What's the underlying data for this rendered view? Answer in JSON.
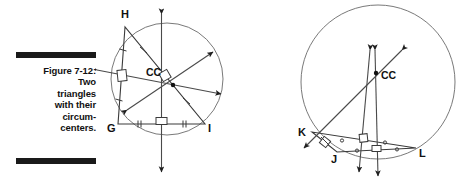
{
  "figure": {
    "number_label": "Figure 7-12:",
    "caption_lines": [
      "Figure 7-12:",
      "Two",
      "triangles",
      "with their",
      "circum-",
      "centers."
    ],
    "caption_full": "Figure 7-12: Two triangles with their circumcenters.",
    "rule_color": "#1a1a1a",
    "ink_color": "#111111",
    "line_color": "#444444"
  },
  "diagrams": [
    {
      "id": "left-triangle",
      "description": "Acute triangle GHI inscribed in a circle with circumcenter CC inside the triangle",
      "circle": {
        "cx": 72,
        "cy": 79,
        "r": 56
      },
      "circumcenter": {
        "label": "CC",
        "x": 78,
        "y": 85,
        "label_x": 54,
        "label_y": 74
      },
      "vertices": [
        {
          "label": "H",
          "x": 30,
          "y": 27,
          "label_x": 26,
          "label_y": 18
        },
        {
          "label": "G",
          "x": 23,
          "y": 124,
          "label_x": 14,
          "label_y": 131
        },
        {
          "label": "I",
          "x": 110,
          "y": 124,
          "label_x": 113,
          "label_y": 131
        }
      ],
      "tick_marks": [
        {
          "side": "GH",
          "count": 1
        },
        {
          "side": "GI",
          "count": 2
        },
        {
          "side": "HI",
          "count": 3
        }
      ],
      "right_angle_marks": 3,
      "bisector_count": 3
    },
    {
      "id": "right-triangle",
      "description": "Obtuse triangle KJL inscribed in a circle with circumcenter CC outside the triangle",
      "circle": {
        "cx": 98,
        "cy": 82,
        "r": 77
      },
      "circumcenter": {
        "label": "CC",
        "x": 96,
        "y": 73,
        "label_x": 102,
        "label_y": 78
      },
      "vertices": [
        {
          "label": "K",
          "x": 32,
          "y": 132,
          "label_x": 20,
          "label_y": 133
        },
        {
          "label": "J",
          "x": 57,
          "y": 152,
          "label_x": 52,
          "label_y": 160
        },
        {
          "label": "L",
          "x": 136,
          "y": 148,
          "label_x": 139,
          "label_y": 155
        }
      ],
      "tick_marks": [
        {
          "side": "KJ",
          "count": 1
        },
        {
          "side": "JL",
          "count": 2
        },
        {
          "side": "KL",
          "count": 3
        }
      ],
      "right_angle_marks": 3,
      "bisector_count": 3
    }
  ]
}
